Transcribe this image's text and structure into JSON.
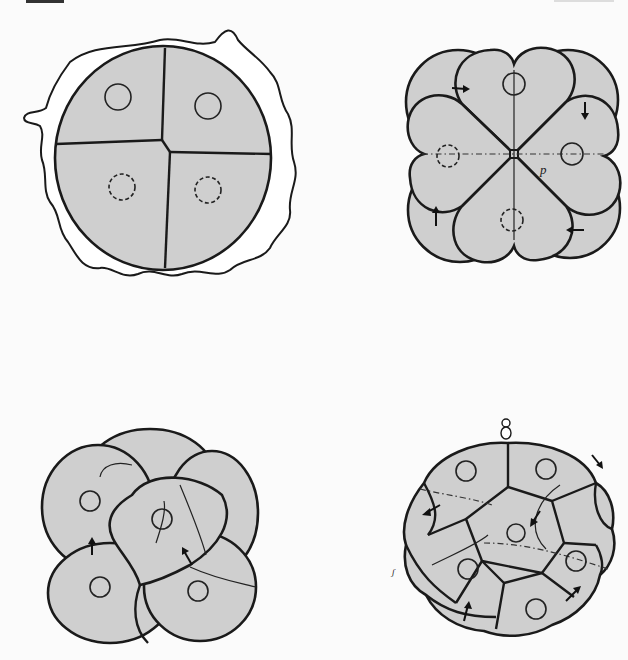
{
  "page": {
    "header_left": "222",
    "header_right": "",
    "background": "#fbfbfb",
    "cell_fill": "#cfcfcf",
    "line_color": "#1a1a1a"
  },
  "figures": [
    {
      "id": "fig-a",
      "position": "top-left",
      "stage": "4-cell",
      "description": "Four-cell embryo inside an irregular wavy outer membrane, each blastomere with a circular nucleus (two dashed)",
      "cells": 4,
      "nuclei": 4,
      "labels": []
    },
    {
      "id": "fig-b",
      "position": "top-right",
      "stage": "8-cell (top view)",
      "description": "Eight-cell embryo seen from the animal pole; four upper heart-shaped cells rotated over four lower cells, dashed cross axes, arrows indicating spiral rotation",
      "cells": 8,
      "nuclei": 4,
      "arrows": 4,
      "labels": [
        "p"
      ]
    },
    {
      "id": "fig-c",
      "position": "bottom-left",
      "stage": "8-cell (oblique view)",
      "description": "Overlapping rounded blastomeres viewed obliquely with a central triangular cell; arrows indicating displacement",
      "cells": 8,
      "nuclei": 4,
      "arrows": 2,
      "labels": []
    },
    {
      "id": "fig-d",
      "position": "bottom-right",
      "stage": "16-cell",
      "description": "Sixteen-cell embryo with polar body at the top, polygonal cell outlines, dashed division planes and multiple arrows",
      "cells": 16,
      "nuclei": 6,
      "arrows": 6,
      "labels": [
        "polar body"
      ]
    }
  ]
}
